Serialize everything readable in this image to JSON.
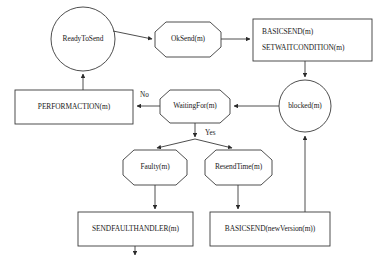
{
  "diagram": {
    "stroke_color": "#3a3a3a",
    "text_color": "#1a1a1a",
    "background_color": "#ffffff",
    "nodes": [
      {
        "id": "ready-to-send",
        "shape": "circle",
        "label": "ReadyToSend",
        "lines": [
          "ReadyToSend"
        ]
      },
      {
        "id": "ok-send",
        "shape": "octagon",
        "label": "OkSend(m)",
        "lines": [
          "OkSend(m)"
        ]
      },
      {
        "id": "basicsend-setwaitcondition",
        "shape": "rectangle",
        "label": "BASICSEND(m) SETWAITCONDITION(m)",
        "lines": [
          "BASICSEND(m)",
          "SETWAITCONDITION(m)"
        ]
      },
      {
        "id": "blocked",
        "shape": "circle",
        "label": "blocked(m)",
        "lines": [
          "blocked(m)"
        ]
      },
      {
        "id": "waiting-for",
        "shape": "octagon",
        "label": "WaitingFor(m)",
        "lines": [
          "WaitingFor(m)"
        ]
      },
      {
        "id": "performaction",
        "shape": "rectangle",
        "label": "PERFORMACTION(m)",
        "lines": [
          "PERFORMACTION(m)"
        ]
      },
      {
        "id": "faulty",
        "shape": "octagon",
        "label": "Faulty(m)",
        "lines": [
          "Faulty(m)"
        ]
      },
      {
        "id": "resend-time",
        "shape": "octagon",
        "label": "ResendTime(m)",
        "lines": [
          "ResendTime(m)"
        ]
      },
      {
        "id": "sendfaulthandler",
        "shape": "rectangle",
        "label": "SENDFAULTHANDLER(m)",
        "lines": [
          "SENDFAULTHANDLER(m)"
        ]
      },
      {
        "id": "basicsend-newversion",
        "shape": "rectangle",
        "label": "BASICSEND(newVersion(m))",
        "lines": [
          "BASICSEND(newVersion(m))"
        ]
      }
    ],
    "edge_labels": [
      {
        "id": "no-label",
        "text": "No"
      },
      {
        "id": "yes-label",
        "text": "Yes"
      }
    ],
    "edges": [
      {
        "from": "ready-to-send",
        "to": "ok-send"
      },
      {
        "from": "ok-send",
        "to": "basicsend-setwaitcondition"
      },
      {
        "from": "basicsend-setwaitcondition",
        "to": "blocked"
      },
      {
        "from": "blocked",
        "to": "waiting-for"
      },
      {
        "from": "waiting-for",
        "to": "performaction",
        "label": "No"
      },
      {
        "from": "performaction",
        "to": "ready-to-send"
      },
      {
        "from": "waiting-for",
        "to": "faulty",
        "label": "Yes"
      },
      {
        "from": "waiting-for",
        "to": "resend-time",
        "label": "Yes"
      },
      {
        "from": "faulty",
        "to": "sendfaulthandler"
      },
      {
        "from": "resend-time",
        "to": "basicsend-newversion"
      },
      {
        "from": "basicsend-newversion",
        "to": "blocked"
      },
      {
        "from": "sendfaulthandler",
        "to": "exit"
      }
    ]
  }
}
